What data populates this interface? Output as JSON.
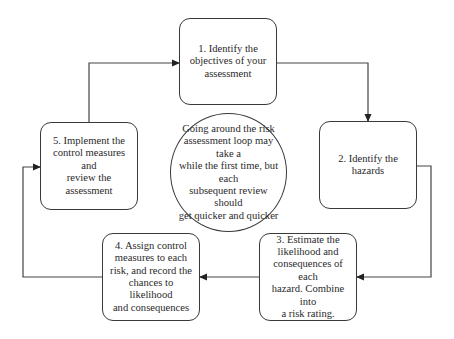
{
  "diagram": {
    "type": "cycle",
    "steps": [
      {
        "id": 1,
        "label": "1. Identify the\nobjectives of your\nassessment"
      },
      {
        "id": 2,
        "label": "2. Identify the\nhazards"
      },
      {
        "id": 3,
        "label": "3. Estimate the\nlikelihood and\nconsequences of each\nhazard. Combine into\na risk rating."
      },
      {
        "id": 4,
        "label": "4. Assign control\nmeasures to each\nrisk, and record the\nchances to likelihood\nand consequences"
      },
      {
        "id": 5,
        "label": "5. Implement the\ncontrol measures and\nreview the\nassessment"
      }
    ],
    "center_note": "Going around the risk\nassessment  loop may take a\nwhile the first time, but each\nsubsequent review should\nget quicker and quicker",
    "edges": [
      {
        "from": 1,
        "to": 2
      },
      {
        "from": 2,
        "to": 3
      },
      {
        "from": 3,
        "to": 4
      },
      {
        "from": 4,
        "to": 5
      },
      {
        "from": 5,
        "to": 1
      }
    ],
    "colors": {
      "stroke": "#3a3a3a",
      "text": "#2a2a2a",
      "background": "#ffffff"
    }
  }
}
